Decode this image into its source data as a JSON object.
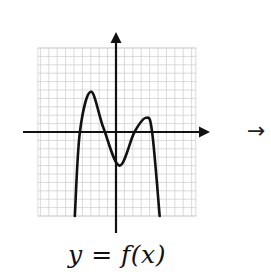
{
  "chart_data": {
    "type": "line",
    "title": "",
    "caption": "y = f(x)",
    "xlabel": "",
    "ylabel": "",
    "grid": true,
    "axis_ranges": {
      "xlim": [
        -9.3,
        9.5
      ],
      "ylim": [
        -10,
        10
      ]
    },
    "series": [
      {
        "name": "f(x)",
        "points": [
          [
            -4.9,
            -10
          ],
          [
            -4.3,
            0
          ],
          [
            -3.0,
            4.8
          ],
          [
            -1.5,
            0.5
          ],
          [
            0.4,
            -4.0
          ],
          [
            2.2,
            0
          ],
          [
            3.6,
            1.7
          ],
          [
            4.3,
            0
          ],
          [
            5.2,
            -10
          ]
        ]
      }
    ],
    "annotations": [
      "→"
    ]
  },
  "caption": "y = f(x)",
  "side_arrow": "→",
  "colors": {
    "grid": "#cfcfcf",
    "axis": "#111111",
    "curve": "#111111"
  }
}
